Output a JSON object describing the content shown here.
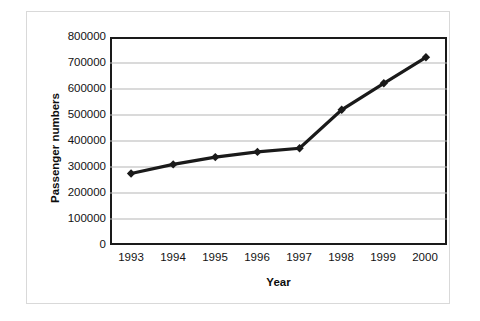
{
  "chart_data": {
    "type": "line",
    "title": "",
    "xlabel": "Year",
    "ylabel": "Passenger numbers",
    "categories": [
      "1993",
      "1994",
      "1995",
      "1996",
      "1997",
      "1998",
      "1999",
      "2000"
    ],
    "x": [
      1993,
      1994,
      1995,
      1996,
      1997,
      1998,
      1999,
      2000
    ],
    "values": [
      275000,
      310000,
      338000,
      358000,
      372000,
      520000,
      622000,
      722000
    ],
    "series": [
      {
        "name": "Passenger numbers",
        "values": [
          275000,
          310000,
          338000,
          358000,
          372000,
          520000,
          622000,
          722000
        ],
        "color": "#1a1a1a",
        "marker": "diamond",
        "line_width": 3
      }
    ],
    "ylim": [
      0,
      800000
    ],
    "yticks": [
      0,
      100000,
      200000,
      300000,
      400000,
      500000,
      600000,
      700000,
      800000
    ],
    "ytick_labels": [
      "0",
      "100000",
      "200000",
      "300000",
      "400000",
      "500000",
      "600000",
      "700000",
      "800000"
    ],
    "xtick_labels": [
      "1993",
      "1994",
      "1995",
      "1996",
      "1997",
      "1998",
      "1999",
      "2000"
    ],
    "grid": {
      "horizontal": true,
      "vertical": false,
      "color": "#b5b5b5"
    },
    "legend": {
      "visible": false,
      "position": "none"
    },
    "plot_border_color": "#1a1a1a",
    "background_color": "#ffffff"
  },
  "axes": {
    "y_title": "Passenger numbers",
    "x_title": "Year"
  }
}
